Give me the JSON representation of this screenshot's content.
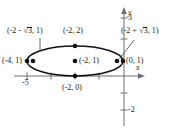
{
  "figure": {
    "type": "ellipse-graph",
    "axes": {
      "x_axis_label": "x",
      "y_axis_label": "y",
      "x_ticks": [
        {
          "label": "-5",
          "value": -5
        }
      ],
      "y_ticks": [
        {
          "label": "3",
          "value": 3
        },
        {
          "label": "-2",
          "value": -2
        }
      ]
    },
    "labels": {
      "left_focus": "(-2 - ",
      "left_focus_radicand": "3",
      "left_focus_tail": ", 1)",
      "top_vertex": "(-2, 2)",
      "right_focus": "(-2 + ",
      "right_focus_radicand": "3",
      "right_focus_tail": ", 1)",
      "left_vertex": "(-4, 1)",
      "center": "(-2, 1)",
      "right_vertex": "(0, 1)",
      "bottom_vertex": "(-2, 0)"
    },
    "points": [
      {
        "name": "left-vertex",
        "coords": "(-4, 1)"
      },
      {
        "name": "top-vertex",
        "coords": "(-2, 2)"
      },
      {
        "name": "center",
        "coords": "(-2, 1)"
      },
      {
        "name": "right-vertex",
        "coords": "(0, 1)"
      },
      {
        "name": "bottom-vertex",
        "coords": "(-2, 0)"
      },
      {
        "name": "left-focus",
        "coords": "(-2 - sqrt3, 1)"
      },
      {
        "name": "right-focus",
        "coords": "(-2 + sqrt3, 1)"
      }
    ],
    "colors": {
      "stroke": "#1a1a1a",
      "axis": "#6e6e6e",
      "background": "#ffffff"
    }
  }
}
